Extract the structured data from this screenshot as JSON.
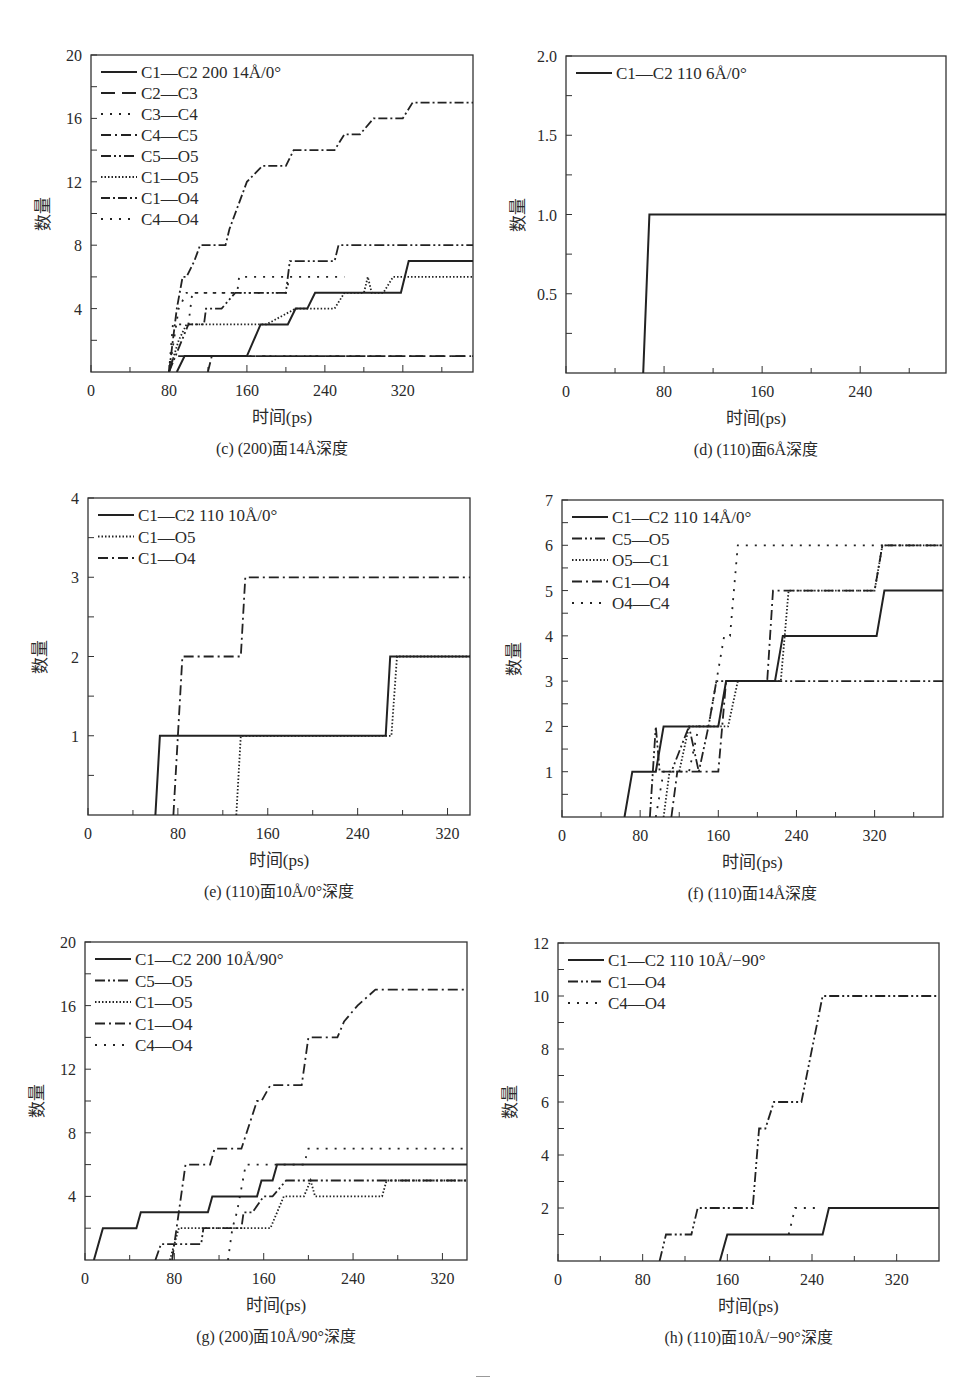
{
  "chart_data": [
    {
      "id": "c",
      "type": "line",
      "caption": "(c) (200)面14Å深度",
      "xlabel": "时间(ps)",
      "ylabel": "数量",
      "xlim": [
        0,
        392
      ],
      "ylim": [
        0,
        20
      ],
      "xticks": [
        0,
        80,
        160,
        240,
        320
      ],
      "yticks": [
        4,
        8,
        12,
        16,
        20
      ],
      "box": {
        "left": 91,
        "top": 55,
        "right": 473,
        "bottom": 372
      },
      "legend_position": "upper left",
      "series": [
        {
          "name": "C1—C2  200 14Å/0°",
          "style": "solid",
          "x": [
            88,
            96,
            160,
            174,
            202,
            210,
            214,
            222,
            230,
            318,
            326,
            392
          ],
          "y": [
            0,
            1,
            1,
            3,
            3,
            4,
            4,
            4,
            5,
            5,
            7,
            7
          ]
        },
        {
          "name": "C2—C3",
          "style": "longdash",
          "x": [
            80,
            85,
            392
          ],
          "y": [
            0,
            1,
            1
          ]
        },
        {
          "name": "C3—C4",
          "style": "dot-sparse",
          "x": [
            80,
            84,
            100,
            104,
            150,
            152,
            250,
            254,
            260
          ],
          "y": [
            0,
            3,
            3,
            5,
            5,
            6,
            6,
            6,
            6
          ]
        },
        {
          "name": "C4—C5",
          "style": "dashdot",
          "x": [
            120,
            124,
            390
          ],
          "y": [
            0,
            1,
            1
          ]
        },
        {
          "name": "C5—O5",
          "style": "dashdotdot",
          "x": [
            80,
            100,
            116,
            118,
            130,
            134,
            148,
            150,
            200,
            204,
            250,
            254,
            392
          ],
          "y": [
            0,
            3,
            3,
            4,
            4,
            4,
            5,
            5,
            5,
            7,
            7,
            8,
            8
          ]
        },
        {
          "name": "C1—O5",
          "style": "dotted",
          "x": [
            80,
            90,
            98,
            100,
            170,
            180,
            210,
            250,
            260,
            280,
            284,
            288,
            300,
            310,
            392
          ],
          "y": [
            0,
            2,
            3,
            3,
            3,
            3,
            4,
            4,
            5,
            5,
            6,
            5,
            5,
            6,
            6
          ]
        },
        {
          "name": "C1—O4",
          "style": "dashdot-dense",
          "x": [
            80,
            88,
            94,
            98,
            106,
            112,
            120,
            124,
            138,
            142,
            148,
            160,
            176,
            182,
            200,
            208,
            222,
            250,
            260,
            276,
            290,
            310,
            320,
            330,
            340,
            392
          ],
          "y": [
            0,
            4,
            6,
            6,
            7,
            8,
            8,
            8,
            8,
            9,
            10,
            12,
            13,
            13,
            13,
            14,
            14,
            14,
            15,
            15,
            16,
            16,
            16,
            17,
            17,
            17
          ]
        },
        {
          "name": "C4—O4",
          "style": "dot-sparse",
          "x": [
            80,
            90,
            98,
            100,
            148,
            200,
            204
          ],
          "y": [
            0,
            4,
            5,
            5,
            5,
            5,
            6
          ]
        }
      ]
    },
    {
      "id": "d",
      "type": "line",
      "caption": "(d) (110)面6Å深度",
      "xlabel": "时间(ps)",
      "ylabel": "数量",
      "xlim": [
        0,
        310
      ],
      "ylim": [
        0,
        2.0
      ],
      "xticks": [
        0,
        80,
        160,
        240
      ],
      "yticks": [
        0.5,
        1.0,
        1.5,
        2.0
      ],
      "ytick_format": "fixed1",
      "box": {
        "left": 566,
        "top": 56,
        "right": 946,
        "bottom": 373
      },
      "legend_position": "upper left",
      "series": [
        {
          "name": "C1—C2  110 6Å/0°",
          "style": "solid",
          "x": [
            63,
            68,
            310
          ],
          "y": [
            0,
            1,
            1
          ]
        }
      ]
    },
    {
      "id": "e",
      "type": "line",
      "caption": "(e) (110)面10Å/0°深度",
      "xlabel": "时间(ps)",
      "ylabel": "数量",
      "xlim": [
        0,
        340
      ],
      "ylim": [
        0,
        4
      ],
      "xticks": [
        0,
        80,
        160,
        240,
        320
      ],
      "yticks": [
        1,
        2,
        3,
        4
      ],
      "box": {
        "left": 88,
        "top": 498,
        "right": 470,
        "bottom": 815
      },
      "legend_position": "upper left",
      "series": [
        {
          "name": "C1—C2  110 10Å/0°",
          "style": "solid",
          "x": [
            60,
            64,
            265,
            269,
            340
          ],
          "y": [
            0,
            1,
            1,
            2,
            2
          ]
        },
        {
          "name": "C1—O5",
          "style": "dotted",
          "x": [
            132,
            136,
            270,
            275,
            340
          ],
          "y": [
            0,
            1,
            1,
            2,
            2
          ]
        },
        {
          "name": "C1—O4",
          "style": "dashdot",
          "x": [
            76,
            84,
            136,
            140,
            340
          ],
          "y": [
            0,
            2,
            2,
            3,
            3
          ]
        }
      ]
    },
    {
      "id": "f",
      "type": "line",
      "caption": "(f) (110)面14Å深度",
      "xlabel": "时间(ps)",
      "ylabel": "数量",
      "xlim": [
        0,
        390
      ],
      "ylim": [
        0,
        7
      ],
      "xticks": [
        0,
        80,
        160,
        240,
        320
      ],
      "yticks": [
        1,
        2,
        3,
        4,
        5,
        6,
        7
      ],
      "box": {
        "left": 562,
        "top": 500,
        "right": 943,
        "bottom": 817
      },
      "legend_position": "upper left",
      "series": [
        {
          "name": "C1—C2  110 14Å/0°",
          "style": "solid",
          "x": [
            64,
            72,
            96,
            104,
            160,
            168,
            218,
            226,
            322,
            330,
            390
          ],
          "y": [
            0,
            1,
            1,
            2,
            2,
            3,
            3,
            4,
            4,
            5,
            5
          ]
        },
        {
          "name": "C5—O5",
          "style": "dashdotdot",
          "x": [
            90,
            96,
            100,
            112,
            130,
            140,
            150,
            158,
            390
          ],
          "y": [
            0,
            2,
            1,
            1,
            2,
            1,
            2,
            3,
            3
          ]
        },
        {
          "name": "O5—C1",
          "style": "dotted",
          "x": [
            104,
            110,
            120,
            130,
            170,
            180,
            224,
            232,
            320,
            328,
            390
          ],
          "y": [
            0,
            1,
            1,
            2,
            2,
            3,
            3,
            5,
            5,
            6,
            6
          ]
        },
        {
          "name": "C1—O4",
          "style": "dashdot",
          "x": [
            112,
            118,
            160,
            168,
            210,
            216,
            320,
            328,
            390
          ],
          "y": [
            0,
            1,
            1,
            3,
            3,
            5,
            5,
            6,
            6
          ]
        },
        {
          "name": "O4—C4",
          "style": "dot-sparse",
          "x": [
            96,
            104,
            130,
            140,
            150,
            158,
            166,
            172,
            180,
            390
          ],
          "y": [
            0,
            1,
            1,
            2,
            2,
            3,
            4,
            4,
            6,
            6
          ]
        }
      ]
    },
    {
      "id": "g",
      "type": "line",
      "caption": "(g) (200)面10Å/90°深度",
      "xlabel": "时间(ps)",
      "ylabel": "数量",
      "xlim": [
        0,
        342
      ],
      "ylim": [
        0,
        20
      ],
      "xticks": [
        0,
        80,
        160,
        240,
        320
      ],
      "yticks": [
        4,
        8,
        12,
        16,
        20
      ],
      "box": {
        "left": 85,
        "top": 942,
        "right": 467,
        "bottom": 1260
      },
      "legend_position": "upper left",
      "series": [
        {
          "name": "C1—C2  200 10Å/90°",
          "style": "solid",
          "x": [
            8,
            16,
            46,
            50,
            110,
            114,
            154,
            158,
            168,
            172,
            342
          ],
          "y": [
            0,
            2,
            2,
            3,
            3,
            4,
            4,
            5,
            5,
            6,
            6
          ]
        },
        {
          "name": "C5—O5",
          "style": "dashdotdot",
          "x": [
            63,
            68,
            104,
            106,
            140,
            142,
            150,
            160,
            168,
            180,
            196,
            200,
            342
          ],
          "y": [
            0,
            1,
            1,
            2,
            2,
            3,
            3,
            4,
            4,
            5,
            5,
            5,
            5
          ]
        },
        {
          "name": "C1—O5",
          "style": "dotted",
          "x": [
            76,
            84,
            126,
            130,
            166,
            178,
            196,
            202,
            206,
            266,
            270,
            342
          ],
          "y": [
            0,
            2,
            2,
            2,
            2,
            4,
            4,
            5,
            4,
            4,
            5,
            5
          ]
        },
        {
          "name": "C1—O4",
          "style": "dashdot",
          "x": [
            78,
            90,
            112,
            116,
            140,
            154,
            158,
            166,
            194,
            200,
            226,
            232,
            244,
            260,
            342
          ],
          "y": [
            0,
            6,
            6,
            7,
            7,
            10,
            10,
            11,
            11,
            14,
            14,
            15,
            16,
            17,
            17
          ]
        },
        {
          "name": "C4—O4",
          "style": "dot-sparse",
          "x": [
            128,
            132,
            136,
            144,
            196,
            200,
            342
          ],
          "y": [
            0,
            2,
            3,
            6,
            6,
            7,
            7
          ]
        }
      ]
    },
    {
      "id": "h",
      "type": "line",
      "caption": "(h) (110)面10Å/−90°深度",
      "xlabel": "时间(ps)",
      "ylabel": "数量",
      "xlim": [
        0,
        360
      ],
      "ylim": [
        0,
        12
      ],
      "xticks": [
        0,
        80,
        160,
        240,
        320
      ],
      "yticks": [
        2,
        4,
        6,
        8,
        10,
        12
      ],
      "box": {
        "left": 558,
        "top": 943,
        "right": 939,
        "bottom": 1261
      },
      "legend_position": "upper left",
      "series": [
        {
          "name": "C1—C2  110 10Å/−90°",
          "style": "solid",
          "x": [
            153,
            160,
            250,
            256,
            360
          ],
          "y": [
            0,
            1,
            1,
            2,
            2
          ]
        },
        {
          "name": "C1—O4",
          "style": "dashdotdot",
          "x": [
            96,
            102,
            126,
            132,
            184,
            190,
            196,
            204,
            230,
            250,
            360
          ],
          "y": [
            0,
            1,
            1,
            2,
            2,
            5,
            5,
            6,
            6,
            10,
            10
          ]
        },
        {
          "name": "C4—O4",
          "style": "dot-sparse",
          "x": [
            218,
            224,
            248
          ],
          "y": [
            1,
            2,
            2
          ]
        }
      ]
    }
  ]
}
